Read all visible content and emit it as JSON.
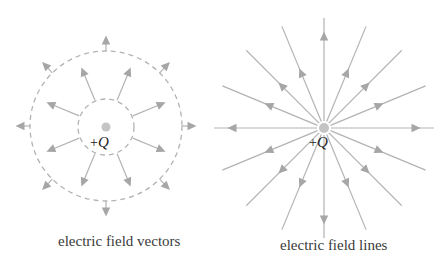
{
  "colors": {
    "line": "#b3b3b3",
    "arrow": "#a6a6a6",
    "charge": "#c4c4c4",
    "text": "#3a3a3a"
  },
  "diagrams": [
    {
      "id": "vectors",
      "charge_sign": "+",
      "charge_symbol": "Q",
      "caption": "electric field vectors",
      "inner_vectors": 8,
      "outer_vectors": 8
    },
    {
      "id": "lines",
      "charge_sign": "+",
      "charge_symbol": "Q",
      "caption": "electric field lines",
      "field_lines": 16
    }
  ]
}
